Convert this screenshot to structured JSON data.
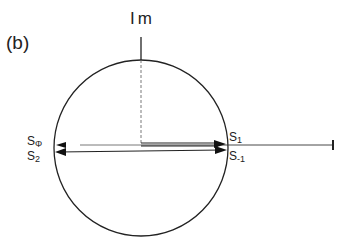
{
  "figure": {
    "panel_label": "(b)",
    "axis_label": "Im",
    "right_axis_label": "R",
    "labels": {
      "s0": {
        "base": "S",
        "sub": "Φ"
      },
      "s2": {
        "base": "S",
        "sub": "2"
      },
      "s1": {
        "base": "S",
        "sub": "1"
      },
      "sm1": {
        "base": "S",
        "sub": "-1"
      }
    },
    "colors": {
      "stroke": "#222222",
      "background": "#ffffff"
    }
  }
}
